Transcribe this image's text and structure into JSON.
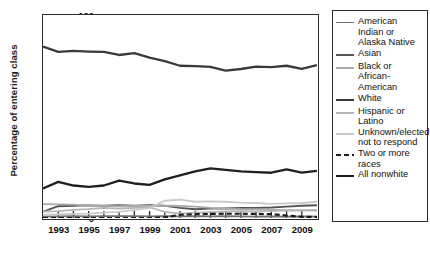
{
  "chart_data": {
    "type": "line",
    "title": "",
    "xlabel": "",
    "ylabel": "Percentage of entering class",
    "xlim": [
      1992,
      2010
    ],
    "ylim": [
      0,
      100
    ],
    "grid": false,
    "legend_position": "right",
    "x": [
      1992,
      1993,
      1994,
      1995,
      1996,
      1997,
      1998,
      1999,
      2000,
      2001,
      2002,
      2003,
      2004,
      2005,
      2006,
      2007,
      2008,
      2009,
      2010
    ],
    "xticks": [
      "1993",
      "1995",
      "1997",
      "1999",
      "2001",
      "2003",
      "2005",
      "2007",
      "2009"
    ],
    "xtick_values": [
      1993,
      1995,
      1997,
      1999,
      2001,
      2003,
      2005,
      2007,
      2009
    ],
    "yticks": [
      "0",
      "10",
      "20",
      "30",
      "40",
      "50",
      "60",
      "70",
      "80",
      "90",
      "100"
    ],
    "ytick_values": [
      0,
      10,
      20,
      30,
      40,
      50,
      60,
      70,
      80,
      90,
      100
    ],
    "series": [
      {
        "name": "American Indian or Alaska Native",
        "color": "#6f6f6f",
        "style": "solid",
        "width": 1.6,
        "values": [
          0.7,
          0.8,
          0.9,
          0.8,
          0.9,
          1.0,
          0.9,
          0.8,
          0.9,
          0.8,
          0.9,
          0.8,
          0.9,
          0.8,
          0.7,
          0.8,
          0.7,
          0.8,
          0.7
        ]
      },
      {
        "name": "Asian",
        "color": "#555555",
        "style": "solid",
        "width": 1.9,
        "values": [
          3.1,
          5.8,
          6.0,
          6.2,
          6.0,
          6.3,
          6.0,
          6.3,
          6.0,
          5.0,
          4.3,
          4.6,
          4.7,
          4.9,
          5.0,
          5.2,
          5.6,
          6.0,
          6.3
        ]
      },
      {
        "name": "Black or African-American",
        "color": "#aaaaaa",
        "style": "solid",
        "width": 1.8,
        "values": [
          6.8,
          6.7,
          6.6,
          6.0,
          6.0,
          5.8,
          5.9,
          6.0,
          6.1,
          6.0,
          5.6,
          5.0,
          4.6,
          4.4,
          4.2,
          4.0,
          3.9,
          3.8,
          3.7
        ]
      },
      {
        "name": "White",
        "color": "#3a3a3a",
        "style": "solid",
        "width": 2.3,
        "values": [
          84.5,
          81.8,
          82.3,
          82.0,
          81.8,
          80.3,
          81.2,
          79.0,
          77.3,
          75.0,
          74.8,
          74.4,
          72.6,
          73.4,
          74.6,
          74.3,
          75.0,
          73.5,
          75.3
        ]
      },
      {
        "name": "Hispanic or Latino",
        "color": "#b5b5b5",
        "style": "solid",
        "width": 1.8,
        "values": [
          3.2,
          3.4,
          4.0,
          4.4,
          5.0,
          4.6,
          5.0,
          5.3,
          3.0,
          2.2,
          2.6,
          2.9,
          3.2,
          3.4,
          3.3,
          3.5,
          3.6,
          3.8,
          4.0
        ]
      },
      {
        "name": "Unknown/elected not to respond",
        "color": "#c9c9c9",
        "style": "solid",
        "width": 1.8,
        "values": [
          1.5,
          1.8,
          2.0,
          2.2,
          2.6,
          3.0,
          4.0,
          5.0,
          8.5,
          9.0,
          8.0,
          8.2,
          8.0,
          7.6,
          7.4,
          7.0,
          7.2,
          7.4,
          8.0
        ]
      },
      {
        "name": "Two or more races",
        "color": "#1a1a1a",
        "style": "dashed",
        "width": 2.2,
        "values": [
          0,
          0,
          0,
          0,
          0,
          0,
          0,
          0,
          0.3,
          1.6,
          1.9,
          2.0,
          2.1,
          2.1,
          2.0,
          1.9,
          1.2,
          0.6,
          0.5
        ]
      },
      {
        "name": "All nonwhite",
        "color": "#1f1f1f",
        "style": "solid",
        "width": 2.3,
        "values": [
          14.5,
          17.8,
          16.0,
          15.3,
          16.0,
          18.4,
          17.0,
          16.3,
          19.0,
          21.0,
          23.0,
          24.4,
          23.7,
          23.0,
          22.6,
          22.3,
          24.0,
          22.4,
          23.2
        ]
      }
    ]
  },
  "legend": {
    "items": [
      {
        "label": "American Indian or Alaska Native",
        "color": "#6f6f6f",
        "style": "solid",
        "width": 1.9
      },
      {
        "label": "Asian",
        "color": "#555555",
        "style": "solid",
        "width": 2.2
      },
      {
        "label": "Black or African-American",
        "color": "#aaaaaa",
        "style": "solid",
        "width": 2.0
      },
      {
        "label": "White",
        "color": "#3a3a3a",
        "style": "solid",
        "width": 2.6
      },
      {
        "label": "Hispanic or Latino",
        "color": "#b5b5b5",
        "style": "solid",
        "width": 2.0
      },
      {
        "label": "Unknown/elected not to respond",
        "color": "#c9c9c9",
        "style": "solid",
        "width": 2.0
      },
      {
        "label": "Two or more races",
        "color": "#1a1a1a",
        "style": "dashed",
        "width": 2.6
      },
      {
        "label": "All nonwhite",
        "color": "#1f1f1f",
        "style": "solid",
        "width": 2.6
      }
    ]
  }
}
